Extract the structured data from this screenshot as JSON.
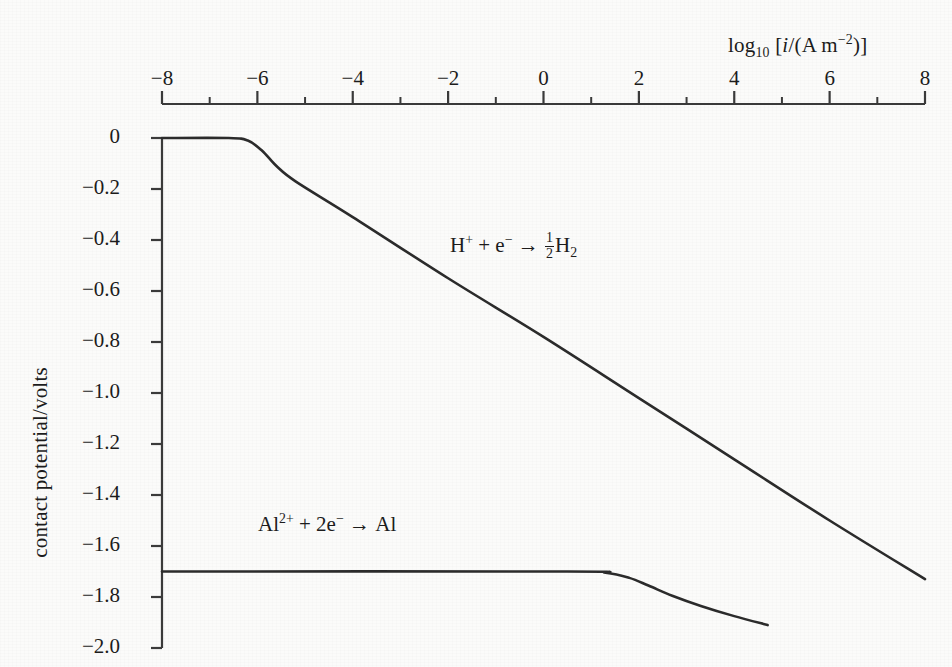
{
  "figure": {
    "background_color": "#fbfbfa",
    "line_color": "#2b2b2b",
    "axis_color": "#3a3a3a"
  },
  "chart_data": {
    "type": "line",
    "title": "",
    "xlabel": "log10 [i/(A m^-2)]",
    "ylabel": "contact potential/volts",
    "xlim": [
      -8,
      8
    ],
    "ylim": [
      -2.0,
      0.0
    ],
    "grid": false,
    "legend": "none",
    "x_axis_position": "top",
    "x_ticks": [
      -8,
      -6,
      -4,
      -2,
      0,
      2,
      4,
      6,
      8
    ],
    "x_tick_labels": [
      "−8",
      "−6",
      "−4",
      "−2",
      "0",
      "2",
      "4",
      "6",
      "8"
    ],
    "x_minor_ticks": [
      -7,
      -5,
      -3,
      -1,
      1,
      3,
      5,
      7
    ],
    "y_ticks": [
      0,
      -0.2,
      -0.4,
      -0.6,
      -0.8,
      -1.0,
      -1.2,
      -1.4,
      -1.6,
      -1.8,
      -2.0
    ],
    "y_tick_labels": [
      "0",
      "−0.2",
      "−0.4",
      "−0.6",
      "−0.8",
      "−1.0",
      "−1.2",
      "−1.4",
      "−1.6",
      "−1.8",
      "−2.0"
    ],
    "series": [
      {
        "name": "hydrogen-evolution",
        "label_plain": "H+ + e- → ½H2",
        "points": [
          {
            "x": -8.0,
            "y": 0.0
          },
          {
            "x": -6.6,
            "y": 0.0
          },
          {
            "x": -6.2,
            "y": -0.01
          },
          {
            "x": -5.9,
            "y": -0.05
          },
          {
            "x": -5.6,
            "y": -0.11
          },
          {
            "x": -5.2,
            "y": -0.17
          },
          {
            "x": -4.0,
            "y": -0.31
          },
          {
            "x": -2.0,
            "y": -0.55
          },
          {
            "x": 0.0,
            "y": -0.78
          },
          {
            "x": 2.0,
            "y": -1.02
          },
          {
            "x": 4.0,
            "y": -1.26
          },
          {
            "x": 6.0,
            "y": -1.5
          },
          {
            "x": 8.0,
            "y": -1.73
          }
        ],
        "plateau_value": 0.0,
        "knee_x": -6.0,
        "end_value": -1.73
      },
      {
        "name": "aluminium-deposition",
        "label_plain": "Al2+ + 2e- → Al",
        "points": [
          {
            "x": -8.0,
            "y": -1.7
          },
          {
            "x": 0.5,
            "y": -1.7
          },
          {
            "x": 1.3,
            "y": -1.705
          },
          {
            "x": 1.8,
            "y": -1.725
          },
          {
            "x": 2.2,
            "y": -1.755
          },
          {
            "x": 2.7,
            "y": -1.795
          },
          {
            "x": 3.3,
            "y": -1.835
          },
          {
            "x": 4.0,
            "y": -1.875
          },
          {
            "x": 4.7,
            "y": -1.91
          }
        ],
        "plateau_value": -1.7,
        "knee_x": 1.6,
        "end_value": -1.91
      }
    ],
    "annotations": [
      {
        "name": "hydrogen-curve-label",
        "text": "H+ + e- → ½H2",
        "x_px": 450,
        "y_px": 232
      },
      {
        "name": "aluminium-curve-label",
        "text": "Al2+ + 2e- → Al",
        "x_px": 258,
        "y_px": 511
      }
    ]
  },
  "axis": {
    "x_title_parts": {
      "log": "log",
      "base": "10",
      "bracket_open": " [",
      "symbol": "i",
      "slash": "/(A m",
      "exponent": "−2",
      "bracket_close": ")]"
    },
    "y_title": "contact potential/volts"
  },
  "labels": {
    "hydrogen": {
      "species_h": "H",
      "charge_plus": "+",
      "plus_sign": "+",
      "species_e": "e",
      "charge_minus": "−",
      "arrow": "→",
      "frac_num": "1",
      "frac_den": "2",
      "product": "H",
      "product_sub": "2"
    },
    "aluminium": {
      "species_al": "Al",
      "charge": "2+",
      "plus_sign": "+",
      "coefficient_e": "2e",
      "charge_minus": "−",
      "arrow": "→",
      "product": "Al"
    }
  }
}
